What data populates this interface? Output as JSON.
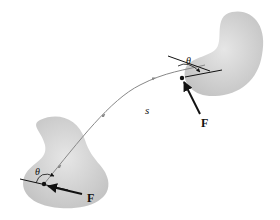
{
  "diagram": {
    "labels": {
      "path": "s",
      "force_start": "F",
      "force_end": "F",
      "angle_start": "θ",
      "angle_end": "θ"
    },
    "colors": {
      "body_fill": "#cfcfcf",
      "path": "#888888",
      "force": "#111111"
    }
  }
}
